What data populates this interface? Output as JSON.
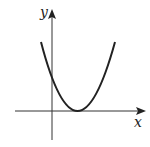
{
  "diagram": {
    "type": "function-graph",
    "axes": {
      "x_label": "x",
      "y_label": "y"
    },
    "curve": {
      "shape": "parabola",
      "opens": "up",
      "vertex": "touches x-axis to the right of origin",
      "y_intercept": "positive"
    },
    "colors": {
      "stroke": "#222222",
      "background": "#ffffff"
    }
  }
}
